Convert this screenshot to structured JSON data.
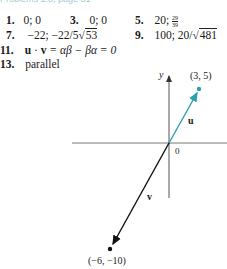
{
  "header": {
    "text": "Problems 1.3, page 31"
  },
  "answers": [
    {
      "num": "1.",
      "text": "0; 0"
    },
    {
      "num": "3.",
      "text": "0; 0"
    },
    {
      "num": "5.",
      "text_prefix": "20; ",
      "frac_num": "29",
      "frac_den": "39"
    },
    {
      "num": "7.",
      "text_prefix": "−22; −22/5",
      "radicand": "53"
    },
    {
      "num": "9.",
      "text_prefix": "100; 20/",
      "radicand": "481"
    },
    {
      "num": "11.",
      "lhs_u": "u",
      "dot": " · ",
      "lhs_v": "v",
      "rhs": " = αβ − βα = 0"
    },
    {
      "num": "13.",
      "text": "parallel"
    }
  ],
  "figure": {
    "y_axis_label": "y",
    "origin_label": "0",
    "vector_u": {
      "label": "u",
      "point_label": "(3, 5)",
      "color": "#2aa0b0"
    },
    "vector_v": {
      "label": "v",
      "point_label": "(−6, −10)",
      "color": "#111111"
    },
    "axis_color": "#666666"
  }
}
